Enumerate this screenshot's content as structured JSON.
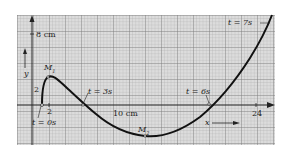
{
  "figure": {
    "type": "motion-trajectory-on-graph-paper",
    "axes": {
      "x_label": "x",
      "y_label": "y",
      "x_tick": "24",
      "y_tick": "2",
      "x_origin_tick": "2",
      "y_scale_label": "8 cm",
      "x_scale_label": "10 cm"
    },
    "points": [
      {
        "id": "M1",
        "label": "M",
        "sub": "1"
      },
      {
        "id": "M2",
        "label": "M",
        "sub": "2"
      }
    ],
    "time_labels": [
      {
        "id": "t0",
        "text": "t = 0s"
      },
      {
        "id": "t3",
        "text": "t = 3s"
      },
      {
        "id": "t6",
        "text": "t = 6s"
      },
      {
        "id": "t7",
        "text": "t = 7s"
      }
    ],
    "colors": {
      "grid_fill": "#d9d9d9",
      "grid_line": "#9a9a9a",
      "curve": "#111111",
      "axis": "#222222"
    }
  }
}
